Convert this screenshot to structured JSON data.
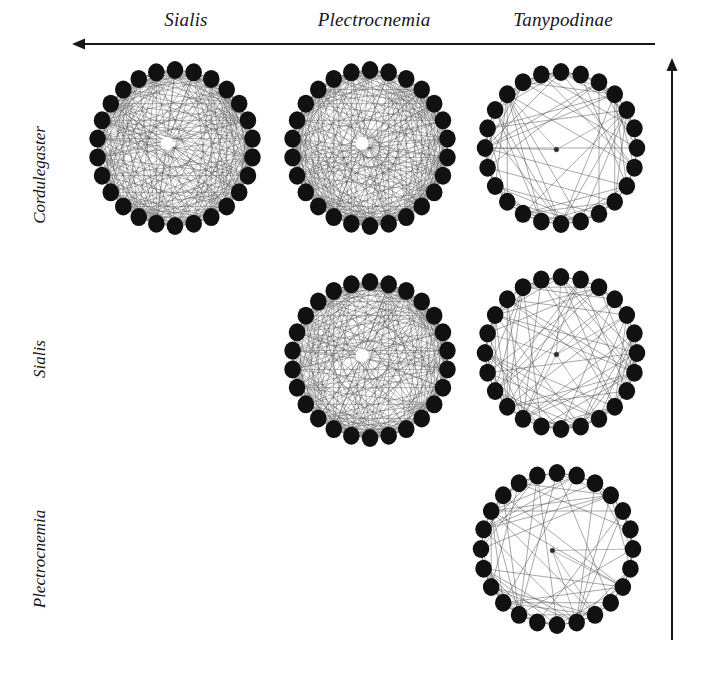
{
  "figure": {
    "type": "network-matrix",
    "background": "#ffffff",
    "ink": "#17161a",
    "edge_color": "#4a4a4a",
    "node_color": "#111111",
    "width": 710,
    "height": 679
  },
  "columns": {
    "axis_name": "column-gradient-arrow",
    "direction": "left",
    "headers": [
      {
        "label": "Sialis",
        "cx": 186,
        "key": "sialis"
      },
      {
        "label": "Plectrocnemia",
        "cx": 374,
        "key": "plectrocnemia"
      },
      {
        "label": "Tanypodinae",
        "cx": 563,
        "key": "tanypodinae"
      }
    ],
    "arrow": {
      "x1": 655,
      "y1": 44,
      "x2": 72,
      "y2": 44
    }
  },
  "rows": {
    "axis_name": "row-gradient-arrow",
    "direction": "up",
    "labels": [
      {
        "label": "Cordulegaster",
        "cy": 176,
        "key": "cordulegaster"
      },
      {
        "label": "Sialis",
        "cy": 360,
        "key": "sialis"
      },
      {
        "label": "Plectrocnemia",
        "cy": 560,
        "key": "plectrocnemia"
      }
    ],
    "arrow": {
      "x1": 672,
      "y1": 640,
      "x2": 672,
      "y2": 58
    }
  },
  "chart_data": {
    "type": "network-matrix",
    "title": "",
    "xlabel": "",
    "ylabel": "",
    "layout": "upper-triangular",
    "node_layout": "circle",
    "legend_position": "none",
    "grid": false,
    "row_categories": [
      "Cordulegaster",
      "Sialis",
      "Plectrocnemia"
    ],
    "column_categories": [
      "Sialis",
      "Plectrocnemia",
      "Tanypodinae"
    ],
    "cells": [
      {
        "row": "Cordulegaster",
        "col": "Sialis",
        "present": true,
        "cx": 175,
        "cy": 148,
        "r": 78,
        "node_r": 9,
        "nodes": 26,
        "density": 0.92,
        "seed": 11,
        "inner_hub": true,
        "description": "very dense circular network"
      },
      {
        "row": "Cordulegaster",
        "col": "Plectrocnemia",
        "present": true,
        "cx": 370,
        "cy": 148,
        "r": 78,
        "node_r": 9,
        "nodes": 26,
        "density": 0.9,
        "seed": 23,
        "inner_hub": true,
        "description": "very dense circular network"
      },
      {
        "row": "Cordulegaster",
        "col": "Tanypodinae",
        "present": true,
        "cx": 561,
        "cy": 148,
        "r": 76,
        "node_r": 9,
        "nodes": 24,
        "density": 0.38,
        "seed": 37,
        "inner_hub": false,
        "description": "sparse circular network"
      },
      {
        "row": "Sialis",
        "col": "Sialis",
        "present": false,
        "cx": 175,
        "cy": 360,
        "r": 0,
        "node_r": 0,
        "nodes": 0,
        "density": 0,
        "seed": 0,
        "inner_hub": false,
        "description": "empty cell"
      },
      {
        "row": "Sialis",
        "col": "Plectrocnemia",
        "present": true,
        "cx": 370,
        "cy": 360,
        "r": 78,
        "node_r": 9,
        "nodes": 26,
        "density": 0.9,
        "seed": 53,
        "inner_hub": true,
        "description": "very dense circular network"
      },
      {
        "row": "Sialis",
        "col": "Tanypodinae",
        "present": true,
        "cx": 561,
        "cy": 353,
        "r": 76,
        "node_r": 9,
        "nodes": 24,
        "density": 0.4,
        "seed": 67,
        "inner_hub": false,
        "description": "sparse circular network"
      },
      {
        "row": "Plectrocnemia",
        "col": "Sialis",
        "present": false,
        "cx": 175,
        "cy": 560,
        "r": 0,
        "node_r": 0,
        "nodes": 0,
        "density": 0,
        "seed": 0,
        "inner_hub": false,
        "description": "empty cell"
      },
      {
        "row": "Plectrocnemia",
        "col": "Plectrocnemia",
        "present": false,
        "cx": 370,
        "cy": 560,
        "r": 0,
        "node_r": 0,
        "nodes": 0,
        "density": 0,
        "seed": 0,
        "inner_hub": false,
        "description": "empty cell"
      },
      {
        "row": "Plectrocnemia",
        "col": "Tanypodinae",
        "present": true,
        "cx": 557,
        "cy": 549,
        "r": 76,
        "node_r": 9,
        "nodes": 24,
        "density": 0.42,
        "seed": 89,
        "inner_hub": false,
        "description": "sparse circular network"
      }
    ]
  }
}
